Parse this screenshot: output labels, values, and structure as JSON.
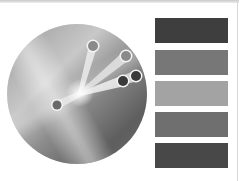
{
  "illustration": {
    "type": "metallic-dial",
    "disc": {
      "cx": 77,
      "cy": 94,
      "r": 70
    },
    "highlight": {
      "x": 80,
      "y": 93
    },
    "knobs": [
      {
        "name": "knob-1",
        "x": 93,
        "y": 46,
        "r": 5,
        "fill": "#8a8a8a"
      },
      {
        "name": "knob-2",
        "x": 126,
        "y": 56,
        "r": 5,
        "fill": "#8a8a8a"
      },
      {
        "name": "knob-3",
        "x": 136,
        "y": 76,
        "r": 5,
        "fill": "#3a3a3a"
      },
      {
        "name": "knob-4",
        "x": 123,
        "y": 81,
        "r": 5,
        "fill": "#3a3a3a"
      },
      {
        "name": "knob-5",
        "x": 57,
        "y": 105,
        "r": 4.5,
        "fill": "#6a6a6a"
      }
    ]
  },
  "swatches": [
    {
      "name": "swatch-1",
      "color": "#3e3e3e",
      "top": 18
    },
    {
      "name": "swatch-2",
      "color": "#777777",
      "top": 50
    },
    {
      "name": "swatch-3",
      "color": "#a3a3a3",
      "top": 81
    },
    {
      "name": "swatch-4",
      "color": "#6f6f6f",
      "top": 112
    },
    {
      "name": "swatch-5",
      "color": "#484848",
      "top": 143
    }
  ]
}
